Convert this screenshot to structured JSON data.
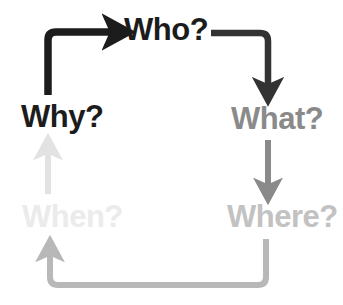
{
  "diagram": {
    "background_color": "#ffffff",
    "nodes": [
      {
        "id": "why",
        "label": "Why?",
        "color": "#1c1c1c"
      },
      {
        "id": "who",
        "label": "Who?",
        "color": "#1c1c1c"
      },
      {
        "id": "what",
        "label": "What?",
        "color": "#8a8a8a"
      },
      {
        "id": "where",
        "label": "Where?",
        "color": "#c2c2c2"
      },
      {
        "id": "when",
        "label": "When?",
        "color": "#ebebeb"
      }
    ],
    "arrows": [
      {
        "id": "why-to-who",
        "from": "why",
        "to": "who",
        "color": "#1c1c1c"
      },
      {
        "id": "who-to-what",
        "from": "who",
        "to": "what",
        "color": "#333333"
      },
      {
        "id": "what-to-where",
        "from": "what",
        "to": "where",
        "color": "#8a8a8a"
      },
      {
        "id": "where-to-when",
        "from": "where",
        "to": "when",
        "color": "#b8b8b8"
      },
      {
        "id": "when-to-why",
        "from": "when",
        "to": "why",
        "color": "#e2e2e2"
      }
    ]
  }
}
